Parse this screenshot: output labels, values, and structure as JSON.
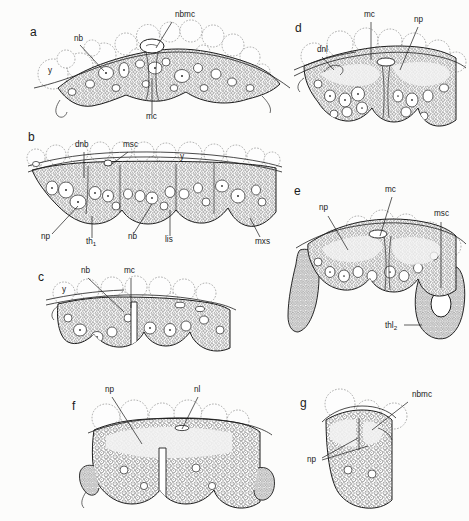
{
  "figure": {
    "background_color": "#fcfcfb",
    "ink_color": "#1a1a1a",
    "yolk_color": "#8d8d8d",
    "width": 469,
    "height": 521,
    "panel_count": 7
  },
  "abbreviations": {
    "nb": "neuroblast",
    "nbmc": "neuroblast mother cell",
    "mc": "midline cells",
    "np": "neuropil",
    "nl": "neural lamella",
    "y": "yolk",
    "dnb": "dorsal neuroblast",
    "msc": "mesectoderm cells",
    "th1": "thoracic segment 1",
    "thl2": "thoracic segment 2",
    "lis": "lateral intersegmental sulcus",
    "mxs": "maxillary segment",
    "dnl": "dorsal neural lamella"
  },
  "panels": [
    {
      "id": "a",
      "letter": "a",
      "letter_pos": {
        "x": 30,
        "y": 36
      },
      "labels": [
        {
          "name": "nbmc",
          "text": "nbmc",
          "x": 175,
          "y": 17,
          "sub": ""
        },
        {
          "name": "nb",
          "text": "nb",
          "x": 74,
          "y": 41,
          "sub": ""
        },
        {
          "name": "y",
          "text": "y",
          "x": 48,
          "y": 73,
          "sub": ""
        },
        {
          "name": "mc",
          "text": "mc",
          "x": 146,
          "y": 119,
          "sub": ""
        }
      ]
    },
    {
      "id": "b",
      "letter": "b",
      "letter_pos": {
        "x": 28,
        "y": 141
      },
      "labels": [
        {
          "name": "dnb",
          "text": "dnb",
          "x": 75,
          "y": 147,
          "sub": ""
        },
        {
          "name": "msc",
          "text": "msc",
          "x": 123,
          "y": 147,
          "sub": ""
        },
        {
          "name": "y",
          "text": "y",
          "x": 180,
          "y": 159,
          "sub": ""
        },
        {
          "name": "np",
          "text": "np",
          "x": 41,
          "y": 239,
          "sub": ""
        },
        {
          "name": "th1",
          "text": "th",
          "x": 86,
          "y": 244,
          "sub": "1"
        },
        {
          "name": "nb",
          "text": "nb",
          "x": 128,
          "y": 239,
          "sub": ""
        },
        {
          "name": "lis",
          "text": "lis",
          "x": 165,
          "y": 242,
          "sub": ""
        },
        {
          "name": "mxs",
          "text": "mxs",
          "x": 255,
          "y": 244,
          "sub": ""
        }
      ]
    },
    {
      "id": "c",
      "letter": "c",
      "letter_pos": {
        "x": 38,
        "y": 281
      },
      "labels": [
        {
          "name": "nb",
          "text": "nb",
          "x": 81,
          "y": 273,
          "sub": ""
        },
        {
          "name": "mc",
          "text": "mc",
          "x": 124,
          "y": 273,
          "sub": ""
        },
        {
          "name": "y",
          "text": "y",
          "x": 62,
          "y": 292,
          "sub": ""
        }
      ]
    },
    {
      "id": "d",
      "letter": "d",
      "letter_pos": {
        "x": 295,
        "y": 32
      },
      "labels": [
        {
          "name": "mc",
          "text": "mc",
          "x": 364,
          "y": 17,
          "sub": ""
        },
        {
          "name": "np",
          "text": "np",
          "x": 414,
          "y": 22,
          "sub": ""
        },
        {
          "name": "dnl",
          "text": "dnl",
          "x": 317,
          "y": 52,
          "sub": ""
        }
      ]
    },
    {
      "id": "e",
      "letter": "e",
      "letter_pos": {
        "x": 294,
        "y": 195
      },
      "labels": [
        {
          "name": "mc",
          "text": "mc",
          "x": 385,
          "y": 192,
          "sub": ""
        },
        {
          "name": "np",
          "text": "np",
          "x": 319,
          "y": 210,
          "sub": ""
        },
        {
          "name": "msc",
          "text": "msc",
          "x": 434,
          "y": 216,
          "sub": ""
        },
        {
          "name": "thl2",
          "text": "thl",
          "x": 385,
          "y": 328,
          "sub": "2"
        }
      ]
    },
    {
      "id": "f",
      "letter": "f",
      "letter_pos": {
        "x": 72,
        "y": 410
      },
      "labels": [
        {
          "name": "np",
          "text": "np",
          "x": 105,
          "y": 392,
          "sub": ""
        },
        {
          "name": "nl",
          "text": "nl",
          "x": 194,
          "y": 392,
          "sub": ""
        }
      ]
    },
    {
      "id": "g",
      "letter": "g",
      "letter_pos": {
        "x": 300,
        "y": 407
      },
      "labels": [
        {
          "name": "nbmc",
          "text": "nbmc",
          "x": 412,
          "y": 397,
          "sub": ""
        },
        {
          "name": "np",
          "text": "np",
          "x": 307,
          "y": 462,
          "sub": ""
        }
      ]
    }
  ]
}
